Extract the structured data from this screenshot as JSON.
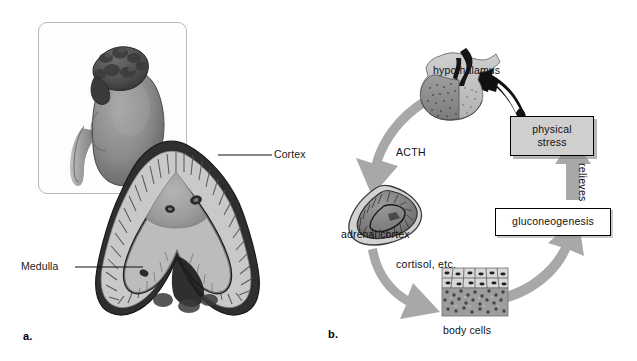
{
  "figure": {
    "background_color": "#ffffff",
    "arrow_gray": "#a8a8a8",
    "stress_box_fill": "#cfcfcf"
  },
  "panel_a": {
    "label": "a.",
    "caption": "Kidney with adrenal gland (inset) and adrenal gland cross section",
    "inset": {
      "name": "kidney-with-adrenal-gland-illustration"
    },
    "cross_section": {
      "name": "adrenal-gland-cross-section-illustration"
    },
    "callouts": [
      {
        "text": "Cortex",
        "target": "outer layer of adrenal gland"
      },
      {
        "text": "Medulla",
        "target": "inner layer of adrenal gland"
      }
    ]
  },
  "panel_b": {
    "label": "b.",
    "caption": "Hormonal feedback cycle of the stress response",
    "nodes": [
      {
        "id": "hypothalamus",
        "label": "hypothalamus",
        "kind": "illustration"
      },
      {
        "id": "adrenal-cortex",
        "label": "adrenal cortex",
        "kind": "illustration"
      },
      {
        "id": "body-cells",
        "label": "body cells",
        "kind": "illustration"
      },
      {
        "id": "gluconeogenesis",
        "label": "gluconeogenesis",
        "kind": "box"
      },
      {
        "id": "physical-stress",
        "label": "physical\nstress",
        "line1": "physical",
        "line2": "stress",
        "kind": "box"
      }
    ],
    "arrow_labels": [
      {
        "id": "acth",
        "text": "ACTH"
      },
      {
        "id": "cortisol",
        "text": "cortisol, etc."
      },
      {
        "id": "relieves",
        "text": "relieves"
      }
    ],
    "flow": [
      {
        "from": "hypothalamus",
        "to": "adrenal-cortex",
        "label": "ACTH",
        "color": "#a8a8a8"
      },
      {
        "from": "adrenal-cortex",
        "to": "body-cells",
        "label": "cortisol, etc.",
        "color": "#a8a8a8"
      },
      {
        "from": "body-cells",
        "to": "gluconeogenesis",
        "label": "",
        "color": "#a8a8a8"
      },
      {
        "from": "gluconeogenesis",
        "to": "physical-stress",
        "label": "relieves",
        "color": "#a8a8a8"
      },
      {
        "from": "physical-stress",
        "to": "hypothalamus",
        "label": "",
        "color": "#111111"
      }
    ]
  }
}
